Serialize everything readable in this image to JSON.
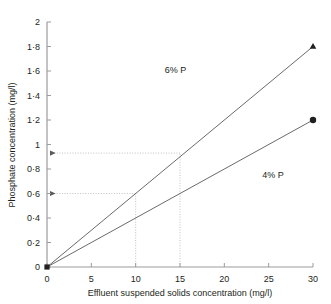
{
  "chart_data": {
    "type": "line",
    "title": "",
    "xlabel": "Effluent suspended solids concentration (mg/l)",
    "ylabel": "Phosphate concentration (mg/l)",
    "xlim": [
      0,
      30
    ],
    "ylim": [
      0,
      2
    ],
    "grid": false,
    "legend_position": "inline-annotation",
    "x_ticks": [
      0,
      5,
      10,
      15,
      20,
      25,
      30
    ],
    "x_tick_labels": [
      "0",
      "5",
      "10",
      "15",
      "20",
      "25",
      "30"
    ],
    "y_ticks": [
      0,
      0.2,
      0.4,
      0.6,
      0.8,
      1.0,
      1.2,
      1.4,
      1.6,
      1.8,
      2.0
    ],
    "y_tick_labels": [
      "0",
      "0·2",
      "0·4",
      "0·6",
      "0·8",
      "1",
      "1·2",
      "1·4",
      "1·6",
      "1·8",
      "2"
    ],
    "series": [
      {
        "name": "6% P",
        "label": "6% P",
        "marker": "triangle",
        "color": "#58595b",
        "x": [
          0,
          30
        ],
        "values": [
          0,
          1.8
        ],
        "slope": 0.06,
        "label_x": 14.5,
        "label_y": 1.58
      },
      {
        "name": "4% P",
        "label": "4% P",
        "marker": "circle",
        "color": "#58595b",
        "x": [
          0,
          30
        ],
        "values": [
          0,
          1.2
        ],
        "slope": 0.04,
        "label_x": 25.5,
        "label_y": 0.73
      }
    ],
    "origin_marker": "square",
    "annotations": [
      {
        "name": "guide-10",
        "x": 10,
        "y": 0.6,
        "arrow_to_axis": true
      },
      {
        "name": "guide-15",
        "x": 15,
        "y": 0.93,
        "arrow_to_axis": true
      }
    ]
  }
}
